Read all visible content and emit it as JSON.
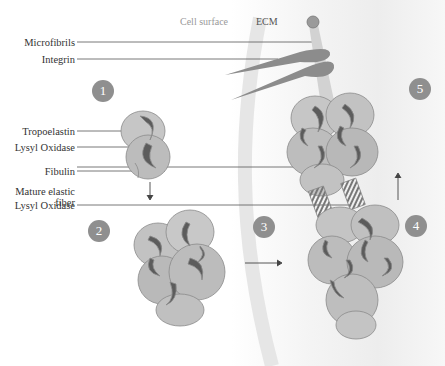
{
  "diagram": {
    "headers": {
      "cell_surface": "Cell surface",
      "ecm": "ECM"
    },
    "labels": [
      {
        "id": "microfibrils",
        "text": "Microfibrils"
      },
      {
        "id": "integrin",
        "text": "Integrin"
      },
      {
        "id": "tropoelastin",
        "text": "Tropoelastin"
      },
      {
        "id": "lysyl_oxidase_1",
        "text": "Lysyl Oxidase"
      },
      {
        "id": "fibulin",
        "text": "Fibulin"
      },
      {
        "id": "mature_fiber",
        "text": "Mature elastic fiber"
      },
      {
        "id": "lysyl_oxidase_2",
        "text": "Lysyl Oxidase"
      }
    ],
    "steps": [
      "1",
      "2",
      "3",
      "4",
      "5"
    ],
    "colors": {
      "globule": "#bdbdbd",
      "globule_edge": "#8a8a8a",
      "crescent": "#5c5c5c",
      "integrin": "#8c8c8c",
      "microfibril": "#cfcfcf",
      "step_badge": "#8f8f8f",
      "leader_line": "#555555"
    }
  }
}
